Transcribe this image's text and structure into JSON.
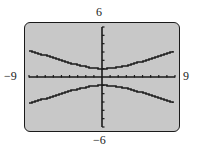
{
  "window": {
    "xmin_label": "−9",
    "xmax_label": "9",
    "ymax_label": "6",
    "ymin_label": "−6"
  },
  "colors": {
    "screen": "#c8c8c8",
    "ink": "#1a1a1a"
  },
  "chart_data": {
    "type": "line",
    "title": "",
    "xlabel": "",
    "ylabel": "",
    "xlim": [
      -9,
      9
    ],
    "ylim": [
      -6,
      6
    ],
    "xscl": 1,
    "yscl": 1,
    "grid": false,
    "tick_labels": {
      "x": [
        "−9",
        "9"
      ],
      "y": [
        "−6",
        "6"
      ]
    },
    "equation": "y^2 - x^2/9 = 1 (hyperbola, vertical transverse axis)",
    "series": [
      {
        "name": "upper branch",
        "x": [
          -9,
          -8,
          -7,
          -6,
          -5,
          -4,
          -3,
          -2,
          -1,
          0,
          1,
          2,
          3,
          4,
          5,
          6,
          7,
          8,
          9
        ],
        "values": [
          3.16,
          2.85,
          2.54,
          2.24,
          1.94,
          1.67,
          1.41,
          1.2,
          1.05,
          1.0,
          1.05,
          1.2,
          1.41,
          1.67,
          1.94,
          2.24,
          2.54,
          2.85,
          3.16
        ]
      },
      {
        "name": "lower branch",
        "x": [
          -9,
          -8,
          -7,
          -6,
          -5,
          -4,
          -3,
          -2,
          -1,
          0,
          1,
          2,
          3,
          4,
          5,
          6,
          7,
          8,
          9
        ],
        "values": [
          -3.16,
          -2.85,
          -2.54,
          -2.24,
          -1.94,
          -1.67,
          -1.41,
          -1.2,
          -1.05,
          -1.0,
          -1.05,
          -1.2,
          -1.41,
          -1.67,
          -1.94,
          -2.24,
          -2.54,
          -2.85,
          -3.16
        ]
      }
    ]
  }
}
